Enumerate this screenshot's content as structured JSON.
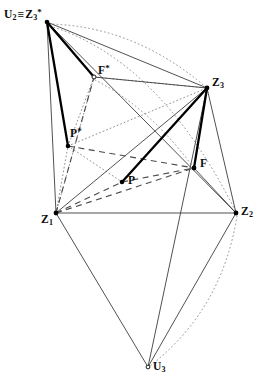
{
  "figure": {
    "width": 268,
    "height": 390,
    "background_color": "#ffffff",
    "stroke_color": "#3a3a3a",
    "bold_stroke_color": "#000000",
    "dotted_color": "#8c8c8c",
    "dashed_color": "#555555"
  },
  "labels": {
    "u2_z3star": {
      "u2": "U",
      "u2_sub": "2",
      "equiv": "≡",
      "z3": "Z",
      "z3_sub": "3",
      "z3_sup": "*",
      "x": 4,
      "y": 8
    },
    "fstar": {
      "text": "F",
      "sup": "*",
      "x": 98,
      "y": 65
    },
    "pstar": {
      "text": "P",
      "sup": "*",
      "x": 70,
      "y": 128
    },
    "z3": {
      "text": "Z",
      "sub": "3",
      "x": 212,
      "y": 78
    },
    "z1": {
      "text": "Z",
      "sub": "1",
      "x": 42,
      "y": 214
    },
    "z2": {
      "text": "Z",
      "sub": "2",
      "x": 241,
      "y": 206
    },
    "p": {
      "text": "P",
      "x": 128,
      "y": 175
    },
    "f": {
      "text": "F",
      "x": 200,
      "y": 158
    },
    "u3": {
      "text": "U",
      "sub": "3",
      "x": 152,
      "y": 362
    }
  },
  "points": {
    "U2": {
      "name": "U2",
      "x": 47,
      "y": 22,
      "filled": true
    },
    "Fstar": {
      "name": "F*",
      "x": 94,
      "y": 77,
      "filled": false
    },
    "Pstar": {
      "name": "P*",
      "x": 68,
      "y": 146,
      "filled": true
    },
    "Z3": {
      "name": "Z3",
      "x": 207,
      "y": 88,
      "filled": true
    },
    "Z1": {
      "name": "Z1",
      "x": 56,
      "y": 213,
      "filled": true
    },
    "Z2": {
      "name": "Z2",
      "x": 236,
      "y": 213,
      "filled": true
    },
    "P": {
      "name": "P",
      "x": 122,
      "y": 182,
      "filled": true
    },
    "F": {
      "name": "F",
      "x": 194,
      "y": 168,
      "filled": true
    },
    "U3": {
      "name": "U3",
      "x": 148,
      "y": 367,
      "filled": false
    }
  },
  "edges": {
    "thin_solid": [
      {
        "from": "U2",
        "to": "Z1",
        "note": "left long edge"
      },
      {
        "from": "U2",
        "to": "Z3",
        "note": "top edge"
      },
      {
        "from": "U2",
        "to": "Z2",
        "note": "to lower right vertex"
      },
      {
        "from": "Z1",
        "to": "Z2",
        "note": "base horizontal"
      },
      {
        "from": "Z1",
        "to": "Z3",
        "note": "diagonal"
      },
      {
        "from": "Z1",
        "to": "U3",
        "note": "lower left leg"
      },
      {
        "from": "Z2",
        "to": "U3",
        "note": "lower right leg"
      },
      {
        "from": "Z3",
        "to": "Z2",
        "note": "right edge"
      },
      {
        "from": "Z3",
        "to": "U3",
        "note": "long right diagonal"
      },
      {
        "from": "F",
        "to": "Z2",
        "note": "short segment"
      },
      {
        "from": "Fstar",
        "to": "Z3",
        "note": "upper segment"
      }
    ],
    "bold_solid": [
      {
        "from": "U2",
        "to": "Fstar"
      },
      {
        "from": "U2",
        "to": "Pstar"
      },
      {
        "from": "Z3",
        "to": "F"
      },
      {
        "from": "Z3",
        "to": "P"
      }
    ],
    "dashed": [
      {
        "from": "Z1",
        "to": "F"
      },
      {
        "from": "Z1",
        "to": "P"
      },
      {
        "from": "Z1",
        "to": "Fstar"
      },
      {
        "from": "P",
        "to": "F"
      },
      {
        "from": "Pstar",
        "to": "F"
      }
    ],
    "dotted": [
      {
        "from": "Z1",
        "to": "Fstar"
      },
      {
        "from": "Z1",
        "to": "Pstar"
      },
      {
        "from": "Pstar",
        "to": "Fstar"
      },
      {
        "from": "Fstar",
        "to": "Z3"
      },
      {
        "from": "Pstar",
        "to": "Z3"
      },
      {
        "from": "Pstar",
        "to": "P"
      }
    ],
    "dotted_arcs": [
      {
        "from": "U2",
        "to": "Z3",
        "note": "upper arc bulging up"
      },
      {
        "from": "U2",
        "to": "Z2",
        "note": "middle long arc"
      },
      {
        "from": "Z2",
        "to": "U3",
        "note": "lower right arc"
      },
      {
        "from": "Fstar",
        "to": "F",
        "note": "inner arc"
      }
    ]
  }
}
